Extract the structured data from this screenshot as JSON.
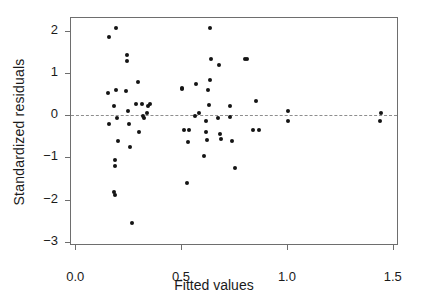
{
  "chart_data": {
    "type": "scatter",
    "title": "",
    "xlabel": "Fitted values",
    "ylabel": "Standardized  residuals",
    "xlim": [
      -0.02,
      1.52
    ],
    "ylim": [
      -3.05,
      2.3
    ],
    "xticks": [
      0.0,
      0.5,
      1.0,
      1.5
    ],
    "xticklabels": [
      "0.0",
      "0.5",
      "1.0",
      "1.5"
    ],
    "yticks": [
      2,
      1,
      0,
      -1,
      -2,
      -3
    ],
    "yticklabels": [
      "2",
      "1",
      "0",
      "-1",
      "-2",
      "-3"
    ],
    "grid": false,
    "legend": null,
    "reference_lines": [
      {
        "name": "zero-residual-line",
        "orientation": "horizontal",
        "y": 0,
        "style": "dashed",
        "color": "#8e8e8e"
      }
    ],
    "marker": {
      "shape": "circle",
      "filled": true,
      "color": "#141414",
      "size": 4
    },
    "series": [
      {
        "name": "residuals",
        "points": [
          [
            0.161,
            1.85
          ],
          [
            0.191,
            2.06
          ],
          [
            0.154,
            0.52
          ],
          [
            0.192,
            0.6
          ],
          [
            0.184,
            0.21
          ],
          [
            0.195,
            -0.06
          ],
          [
            0.161,
            -0.21
          ],
          [
            0.2,
            -0.62
          ],
          [
            0.186,
            -1.05
          ],
          [
            0.188,
            -1.21
          ],
          [
            0.185,
            -1.83
          ],
          [
            0.187,
            -1.88
          ],
          [
            0.244,
            1.42
          ],
          [
            0.246,
            1.28
          ],
          [
            0.238,
            0.57
          ],
          [
            0.25,
            0.09
          ],
          [
            0.255,
            -0.22
          ],
          [
            0.257,
            -0.76
          ],
          [
            0.266,
            -2.55
          ],
          [
            0.296,
            0.79
          ],
          [
            0.288,
            0.26
          ],
          [
            0.317,
            0.27
          ],
          [
            0.303,
            -0.4
          ],
          [
            0.32,
            -0.03
          ],
          [
            0.324,
            -0.06
          ],
          [
            0.346,
            0.21
          ],
          [
            0.352,
            0.26
          ],
          [
            0.34,
            0.05
          ],
          [
            0.506,
            0.62
          ],
          [
            0.506,
            0.64
          ],
          [
            0.512,
            -0.35
          ],
          [
            0.538,
            -0.36
          ],
          [
            0.534,
            -0.64
          ],
          [
            0.528,
            -1.6
          ],
          [
            0.566,
            -0.02
          ],
          [
            0.586,
            0.04
          ],
          [
            0.572,
            0.74
          ],
          [
            0.636,
            2.06
          ],
          [
            0.64,
            1.32
          ],
          [
            0.638,
            0.84
          ],
          [
            0.628,
            0.59
          ],
          [
            0.633,
            0.25
          ],
          [
            0.62,
            -0.14
          ],
          [
            0.618,
            -0.4
          ],
          [
            0.624,
            -0.59
          ],
          [
            0.61,
            -0.97
          ],
          [
            0.679,
            1.18
          ],
          [
            0.676,
            -0.06
          ],
          [
            0.686,
            -0.45
          ],
          [
            0.69,
            -0.56
          ],
          [
            0.733,
            0.22
          ],
          [
            0.73,
            -0.05
          ],
          [
            0.739,
            -0.62
          ],
          [
            0.755,
            -1.25
          ],
          [
            0.802,
            1.34
          ],
          [
            0.812,
            1.33
          ],
          [
            0.852,
            0.33
          ],
          [
            0.841,
            -0.36
          ],
          [
            0.866,
            -0.34
          ],
          [
            1.007,
            0.1
          ],
          [
            1.005,
            -0.15
          ],
          [
            1.445,
            0.05
          ],
          [
            1.44,
            -0.14
          ]
        ]
      }
    ]
  },
  "axes": {
    "x_tick_labels": [
      "0.0",
      "0.5",
      "1.0",
      "1.5"
    ],
    "y_tick_labels": [
      "2",
      "1",
      "0",
      "-1",
      "-2",
      "-3"
    ],
    "x_axis_title": "Fitted values",
    "y_axis_title": "Standardized  residuals"
  },
  "colors": {
    "marker": "#141414",
    "frame": "#6e6e6e",
    "reference_line": "#8e8e8e",
    "background": "#ffffff",
    "text": "#1a1a1a"
  }
}
